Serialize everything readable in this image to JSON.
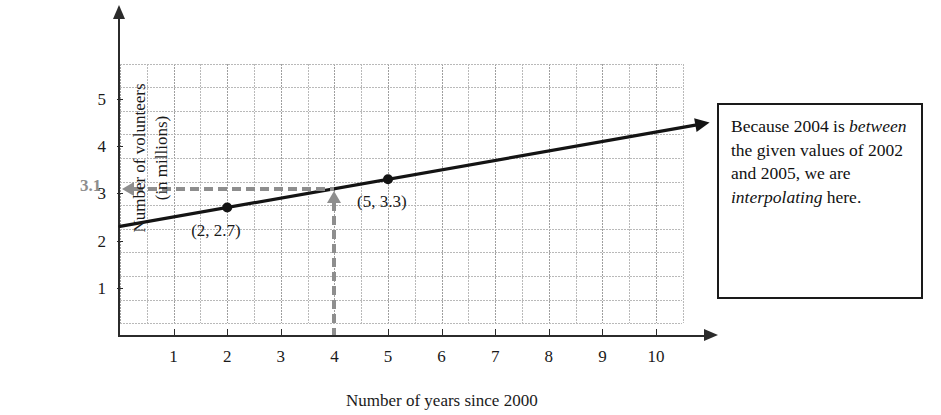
{
  "chart_data": {
    "type": "line",
    "title": "",
    "xlabel": "Number of years since 2000",
    "ylabel_line1": "Number of volunteers",
    "ylabel_line2": "(in millions)",
    "xlim": [
      0,
      11
    ],
    "ylim": [
      0,
      6
    ],
    "xticks": [
      1,
      2,
      3,
      4,
      5,
      6,
      7,
      8,
      9,
      10
    ],
    "xtick_labels": [
      "1",
      "2",
      "3",
      "4",
      "5",
      "6",
      "7",
      "8",
      "9",
      "10"
    ],
    "yticks": [
      1,
      2,
      3,
      4,
      5
    ],
    "ytick_labels": [
      "1",
      "2",
      "3",
      "4",
      "5"
    ],
    "grid": true,
    "grid_minor_step_x": 0.5,
    "grid_minor_step_y": 0.5,
    "legend": "none",
    "series": [
      {
        "name": "Volunteers trend line",
        "type": "line",
        "x": [
          0,
          11
        ],
        "values": [
          2.3,
          4.5
        ],
        "slope": 0.2,
        "intercept": 2.3,
        "arrow_end": true
      }
    ],
    "points": [
      {
        "x": 2,
        "y": 2.7,
        "label": "(2, 2.7)"
      },
      {
        "x": 5,
        "y": 3.3,
        "label": "(5, 3.3)"
      }
    ],
    "annotations": {
      "interpolated_x": 4,
      "interpolated_y": 3.1,
      "interpolated_y_label": "3.1",
      "guide_color": "#8e8e8e",
      "line_color": "#141414",
      "axis_color": "#2b2b2b",
      "grid_color": "#b9b9b9"
    }
  },
  "callout": {
    "line1_a": "Because 2004 is",
    "line2_em": "between",
    "line2_b": " the",
    "line3": "given values of",
    "line4": "2002 and 2005,",
    "line5": "we are",
    "line6_em": "interpolating",
    "line7": "here."
  }
}
